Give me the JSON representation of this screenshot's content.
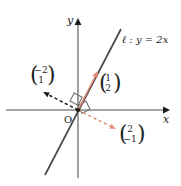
{
  "figure": {
    "type": "coordinate-diagram",
    "background_color": "#ffffff",
    "axes": {
      "x_label": "x",
      "y_label": "y",
      "origin_label": "O",
      "axis_color": "#8a8a8a"
    },
    "line": {
      "name": "ell",
      "label": "ℓ : y = 2x",
      "equation": "y = 2x",
      "slope": 2,
      "intercept": 0,
      "color": "#4a4a4a"
    },
    "vectors": [
      {
        "id": "vector-direction",
        "label_top": "1",
        "label_bottom": "2",
        "components": [
          1,
          2
        ],
        "style": "solid",
        "color": "#e08a7a",
        "description": "direction vector along line ell"
      },
      {
        "id": "vector-normal-left",
        "label_top": "−2",
        "label_bottom": "1",
        "components": [
          -2,
          1
        ],
        "style": "dashed",
        "color": "#1a1a1a",
        "description": "normal vector pointing up-left"
      },
      {
        "id": "vector-normal-right",
        "label_top": "2",
        "label_bottom": "−1",
        "components": [
          2,
          -1
        ],
        "style": "dashed",
        "color": "#e4937f",
        "description": "normal vector pointing down-right"
      }
    ],
    "right_angle_marks": 2
  }
}
